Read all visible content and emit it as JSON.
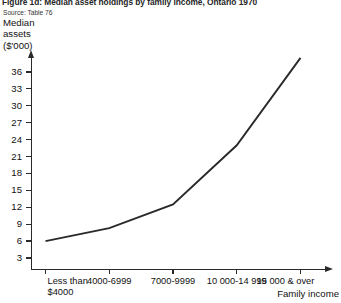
{
  "figure": {
    "title": "Figure 1d: Median asset holdings by family income, Ontario 1970",
    "source": "Source: Table 76",
    "y_axis_caption_line1": "Median",
    "y_axis_caption_line2": "assets",
    "y_axis_caption_line3": "($'000)",
    "x_axis_title": "Family income",
    "line_color": "#2a2a2a",
    "axis_color": "#2a2a2a",
    "background_color": "#ffffff"
  },
  "chart_data": {
    "type": "line",
    "title": "Figure 1d: Median asset holdings by family income, Ontario 1970",
    "xlabel": "Family income",
    "ylabel": "Median assets ($'000)",
    "categories": [
      "Less than\n$4000",
      "4000-6999",
      "7000-9999",
      "10 000-14 999",
      "15 000 & over"
    ],
    "values": [
      6.0,
      8.3,
      12.5,
      23.0,
      38.5
    ],
    "ylim": [
      0,
      39
    ],
    "yticks": [
      3,
      6,
      9,
      12,
      15,
      18,
      21,
      24,
      27,
      30,
      33,
      36
    ],
    "ytick_labels": [
      "3",
      "6",
      "9",
      "12",
      "15",
      "18",
      "21",
      "24",
      "27",
      "30",
      "33",
      "36"
    ],
    "grid": false,
    "legend": false,
    "series": [
      {
        "name": "Median assets",
        "values": [
          6.0,
          8.3,
          12.5,
          23.0,
          38.5
        ]
      }
    ]
  }
}
